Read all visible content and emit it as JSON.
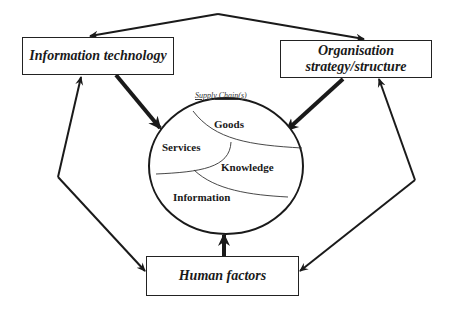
{
  "diagram": {
    "nodes": {
      "it": {
        "label": "Information technology"
      },
      "org": {
        "label_line1": "Organisation",
        "label_line2": "strategy/structure"
      },
      "hf": {
        "label": "Human factors"
      }
    },
    "supply_chain": {
      "title": "Supply Chain(s)",
      "segments": [
        "Goods",
        "Services",
        "Knowledge",
        "Information"
      ]
    },
    "edges": [
      {
        "from": "it",
        "to": "org",
        "style": "thin",
        "arrow": "both"
      },
      {
        "from": "it",
        "to": "hf",
        "style": "thin",
        "arrow": "both"
      },
      {
        "from": "org",
        "to": "hf",
        "style": "thin",
        "arrow": "both"
      },
      {
        "from": "it",
        "to": "supply_chain",
        "style": "thick",
        "arrow": "end"
      },
      {
        "from": "org",
        "to": "supply_chain",
        "style": "thick",
        "arrow": "end"
      },
      {
        "from": "hf",
        "to": "supply_chain",
        "style": "thick",
        "arrow": "end"
      }
    ],
    "colors": {
      "line": "#1a1a1a",
      "background": "#ffffff"
    }
  }
}
